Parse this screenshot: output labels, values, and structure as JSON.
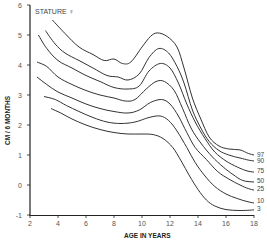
{
  "chart_data": {
    "type": "line",
    "title": "",
    "annotation": "STATURE ♀",
    "xlabel": "AGE IN YEARS",
    "ylabel": "CM / 6 MONTHS",
    "xlim": [
      2,
      18
    ],
    "ylim": [
      -1,
      6
    ],
    "xticks": [
      2,
      4,
      6,
      8,
      10,
      12,
      14,
      16,
      18
    ],
    "yticks": [
      -1,
      0,
      1,
      2,
      3,
      4,
      5,
      6
    ],
    "grid": false,
    "legend_position": "right end labels",
    "series": [
      {
        "name": "97",
        "points": [
          [
            3.6,
            5.5
          ],
          [
            4.5,
            5.05
          ],
          [
            5.5,
            4.6
          ],
          [
            6.5,
            4.35
          ],
          [
            7.3,
            4.15
          ],
          [
            8.0,
            4.2
          ],
          [
            8.6,
            4.05
          ],
          [
            9.2,
            4.1
          ],
          [
            10.0,
            4.6
          ],
          [
            10.6,
            4.95
          ],
          [
            11.1,
            5.07
          ],
          [
            11.8,
            4.95
          ],
          [
            12.5,
            4.6
          ],
          [
            13.0,
            3.9
          ],
          [
            13.6,
            2.9
          ],
          [
            14.2,
            2.2
          ],
          [
            14.8,
            1.6
          ],
          [
            15.5,
            1.3
          ],
          [
            16.2,
            1.2
          ],
          [
            17.0,
            1.17
          ],
          [
            17.6,
            1.05
          ],
          [
            18.0,
            1.0
          ]
        ]
      },
      {
        "name": "90",
        "points": [
          [
            3.1,
            5.15
          ],
          [
            3.8,
            4.7
          ],
          [
            4.5,
            4.4
          ],
          [
            5.5,
            4.15
          ],
          [
            6.5,
            3.9
          ],
          [
            7.5,
            3.65
          ],
          [
            8.3,
            3.6
          ],
          [
            9.0,
            3.5
          ],
          [
            9.8,
            3.7
          ],
          [
            10.5,
            4.25
          ],
          [
            11.2,
            4.55
          ],
          [
            11.9,
            4.4
          ],
          [
            12.5,
            3.95
          ],
          [
            13.0,
            3.4
          ],
          [
            13.6,
            2.5
          ],
          [
            14.2,
            1.9
          ],
          [
            14.8,
            1.45
          ],
          [
            15.5,
            1.15
          ],
          [
            16.2,
            1.0
          ],
          [
            17.0,
            0.9
          ],
          [
            17.6,
            0.83
          ],
          [
            18.0,
            0.8
          ]
        ]
      },
      {
        "name": "75",
        "points": [
          [
            2.6,
            5.0
          ],
          [
            3.2,
            4.55
          ],
          [
            4.0,
            4.15
          ],
          [
            5.0,
            3.9
          ],
          [
            6.0,
            3.65
          ],
          [
            7.0,
            3.45
          ],
          [
            8.0,
            3.25
          ],
          [
            9.0,
            3.2
          ],
          [
            9.8,
            3.3
          ],
          [
            10.5,
            3.8
          ],
          [
            11.3,
            4.05
          ],
          [
            12.0,
            3.9
          ],
          [
            12.6,
            3.4
          ],
          [
            13.2,
            2.7
          ],
          [
            13.8,
            2.1
          ],
          [
            14.5,
            1.55
          ],
          [
            15.2,
            1.1
          ],
          [
            16.0,
            0.8
          ],
          [
            16.8,
            0.6
          ],
          [
            17.5,
            0.47
          ],
          [
            18.0,
            0.43
          ]
        ]
      },
      {
        "name": "50",
        "points": [
          [
            2.5,
            4.1
          ],
          [
            3.2,
            3.95
          ],
          [
            4.0,
            3.6
          ],
          [
            5.0,
            3.35
          ],
          [
            6.0,
            3.15
          ],
          [
            7.0,
            3.0
          ],
          [
            8.0,
            2.9
          ],
          [
            8.8,
            2.8
          ],
          [
            9.5,
            2.85
          ],
          [
            10.3,
            3.2
          ],
          [
            11.0,
            3.45
          ],
          [
            11.6,
            3.45
          ],
          [
            12.3,
            3.15
          ],
          [
            12.9,
            2.55
          ],
          [
            13.5,
            1.9
          ],
          [
            14.2,
            1.4
          ],
          [
            15.0,
            0.95
          ],
          [
            15.8,
            0.6
          ],
          [
            16.5,
            0.35
          ],
          [
            17.2,
            0.15
          ],
          [
            18.0,
            0.1
          ]
        ]
      },
      {
        "name": "25",
        "points": [
          [
            2.5,
            3.6
          ],
          [
            3.2,
            3.35
          ],
          [
            4.0,
            3.1
          ],
          [
            5.0,
            2.9
          ],
          [
            6.0,
            2.7
          ],
          [
            7.0,
            2.55
          ],
          [
            8.0,
            2.45
          ],
          [
            9.0,
            2.4
          ],
          [
            9.8,
            2.5
          ],
          [
            10.6,
            2.75
          ],
          [
            11.4,
            2.85
          ],
          [
            12.0,
            2.7
          ],
          [
            12.6,
            2.3
          ],
          [
            13.2,
            1.75
          ],
          [
            13.8,
            1.25
          ],
          [
            14.6,
            0.85
          ],
          [
            15.4,
            0.45
          ],
          [
            16.2,
            0.2
          ],
          [
            17.0,
            0.0
          ],
          [
            17.6,
            -0.12
          ],
          [
            18.0,
            -0.17
          ]
        ]
      },
      {
        "name": "10",
        "points": [
          [
            3.0,
            2.95
          ],
          [
            3.8,
            2.85
          ],
          [
            4.6,
            2.65
          ],
          [
            5.5,
            2.45
          ],
          [
            6.5,
            2.25
          ],
          [
            7.5,
            2.1
          ],
          [
            8.5,
            2.05
          ],
          [
            9.5,
            2.1
          ],
          [
            10.5,
            2.25
          ],
          [
            11.3,
            2.3
          ],
          [
            11.9,
            2.15
          ],
          [
            12.5,
            1.8
          ],
          [
            13.2,
            1.25
          ],
          [
            13.8,
            0.75
          ],
          [
            14.5,
            0.3
          ],
          [
            15.2,
            -0.05
          ],
          [
            16.0,
            -0.3
          ],
          [
            16.8,
            -0.45
          ],
          [
            17.5,
            -0.55
          ],
          [
            18.0,
            -0.6
          ]
        ]
      },
      {
        "name": "3",
        "points": [
          [
            3.5,
            2.55
          ],
          [
            4.2,
            2.4
          ],
          [
            5.0,
            2.2
          ],
          [
            6.0,
            2.0
          ],
          [
            7.0,
            1.85
          ],
          [
            8.0,
            1.75
          ],
          [
            9.0,
            1.7
          ],
          [
            10.0,
            1.7
          ],
          [
            10.8,
            1.68
          ],
          [
            11.5,
            1.55
          ],
          [
            12.2,
            1.25
          ],
          [
            12.8,
            0.8
          ],
          [
            13.4,
            0.3
          ],
          [
            14.0,
            -0.15
          ],
          [
            14.6,
            -0.5
          ],
          [
            15.2,
            -0.7
          ],
          [
            16.0,
            -0.82
          ],
          [
            17.0,
            -0.85
          ],
          [
            18.0,
            -0.83
          ]
        ]
      }
    ]
  }
}
